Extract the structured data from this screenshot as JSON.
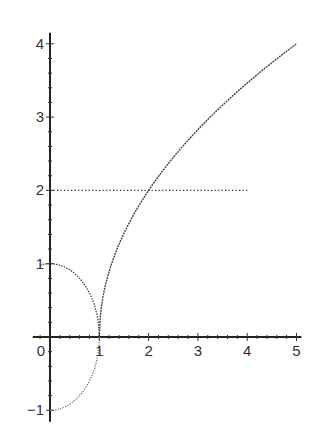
{
  "chart_data": {
    "type": "line",
    "title": "",
    "xlabel": "",
    "ylabel": "",
    "xlim": [
      -0.35,
      5.1
    ],
    "ylim": [
      -1.1,
      4.15
    ],
    "grid": false,
    "legend": null,
    "x_ticks": [
      0,
      1,
      2,
      3,
      4,
      5
    ],
    "x_tick_labels": [
      "0",
      "1",
      "2",
      "3",
      "4",
      "5"
    ],
    "y_ticks": [
      -1,
      1,
      2,
      3,
      4
    ],
    "y_tick_labels": [
      "-1",
      "1",
      "2",
      "3",
      "4"
    ],
    "series": [
      {
        "name": "upper semicircle arc",
        "style": "dotted",
        "description": "y = sqrt(1 - x^2), with a small extension to the left of the y-axis",
        "x": [
          -0.2,
          0,
          0.2,
          0.4,
          0.6,
          0.8,
          0.9,
          0.97,
          1.0
        ],
        "y": [
          0.98,
          1.0,
          0.98,
          0.92,
          0.8,
          0.6,
          0.44,
          0.24,
          0.0
        ]
      },
      {
        "name": "lower semicircle arc",
        "style": "dotted",
        "description": "y = -sqrt(1 - x^2)",
        "x": [
          0,
          0.2,
          0.4,
          0.6,
          0.8,
          0.9,
          0.97,
          1.0
        ],
        "y": [
          -1.0,
          -0.98,
          -0.92,
          -0.8,
          -0.6,
          -0.44,
          -0.24,
          0.0
        ]
      },
      {
        "name": "rising curve",
        "style": "dotted-solid",
        "description": "y = 2*sqrt(x - 1)",
        "x": [
          1,
          1.05,
          1.25,
          1.5,
          2,
          2.5,
          3,
          3.5,
          4,
          4.5,
          5
        ],
        "y": [
          0,
          0.45,
          1.0,
          1.41,
          2.0,
          2.45,
          2.83,
          3.16,
          3.46,
          3.74,
          4.0
        ]
      },
      {
        "name": "horizontal line y=2",
        "style": "dotted",
        "x": [
          0,
          4
        ],
        "y": [
          2,
          2
        ]
      }
    ]
  }
}
